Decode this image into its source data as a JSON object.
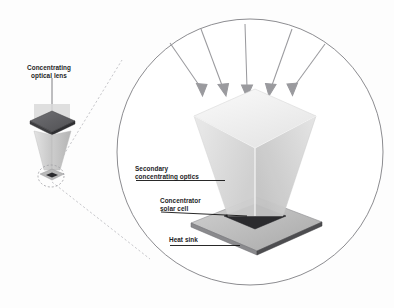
{
  "figure": {
    "background_color": "#fdfdfd",
    "width": 394,
    "height": 308
  },
  "labels": {
    "concentrating_optical_lens": "Concentrating\noptical lens",
    "secondary_concentrating_optics": "Secondary\nconcentrating optics",
    "concentrator_solar_cell": "Concentrator\nsolar cell",
    "heat_sink": "Heat sink"
  },
  "colors": {
    "text": "#1d1d1f",
    "leader_line": "#111111",
    "outline": "#6f6f74",
    "arrow": "#9a9a9e",
    "dashed_callout": "#b9b9be",
    "lens_dark": "#5d5d60",
    "lens_dark_edge": "#3e3e41",
    "frustum_top": "#f3f3f3",
    "frustum_left": "#dcdcdc",
    "frustum_right": "#cfcfcf",
    "solar_cell": "#2b2b2e",
    "heat_sink_top": "#bfbfbf",
    "heat_sink_edge": "#6b6b6e",
    "funnel_light": "#dddddd",
    "funnel_mid": "#c9c9c9"
  },
  "magnifier": {
    "type": "circular-detail-view",
    "center_x": 250,
    "center_y": 152,
    "radius": 133
  },
  "sun_rays": {
    "count": 5,
    "direction": "downward-converging",
    "description": "Five converging incident light rays with arrowheads"
  },
  "small_assembly": {
    "description": "Concentrating optical lens atop an inverted funnel with focus ellipse",
    "focus_marker": "dashed-ellipse"
  }
}
